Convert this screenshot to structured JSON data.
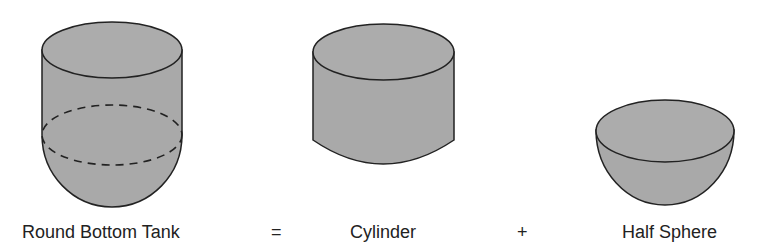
{
  "diagram": {
    "fill_color": "#a9a9a9",
    "stroke_color": "#222222",
    "shapes": [
      {
        "id": "round-bottom-tank",
        "label": "Round Bottom Tank"
      },
      {
        "id": "cylinder",
        "label": "Cylinder"
      },
      {
        "id": "half-sphere",
        "label": "Half Sphere"
      }
    ],
    "operators": {
      "equals": "=",
      "plus": "+"
    }
  }
}
